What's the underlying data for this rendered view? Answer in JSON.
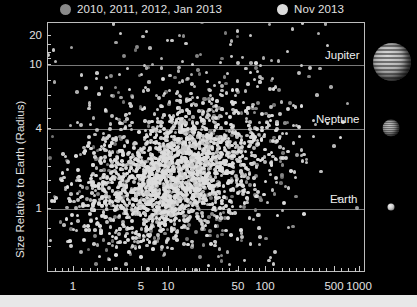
{
  "figure": {
    "background": "#000000",
    "axis_color": "#bdbdbd",
    "text_color": "#e2e2e2"
  },
  "legend": {
    "entries": [
      {
        "label": "2010, 2011, 2012, Jan 2013",
        "color": "#8a8a8a",
        "size": 11,
        "x": 60
      },
      {
        "label": "Nov 2013",
        "color": "#dcdcdc",
        "size": 11,
        "x": 277
      }
    ]
  },
  "axes": {
    "ylabel": "Size Relative to Earth (Radius)",
    "xlabel": "",
    "y_ticks": [
      {
        "value": 20,
        "label": "20",
        "y": 35
      },
      {
        "value": 10,
        "label": "10",
        "y": 64
      },
      {
        "value": 4,
        "label": "4",
        "y": 128
      },
      {
        "value": 1,
        "label": "1",
        "y": 208
      }
    ],
    "x_ticks": [
      {
        "value": 1,
        "label": "1",
        "x": 73
      },
      {
        "value": 5,
        "label": "5",
        "x": 141
      },
      {
        "value": 10,
        "label": "10",
        "x": 168
      },
      {
        "value": 50,
        "label": "50",
        "x": 238
      },
      {
        "value": 100,
        "label": "100",
        "x": 265
      },
      {
        "value": 500,
        "label": "500",
        "x": 334
      },
      {
        "value": 1000,
        "label": "1000",
        "x": 359
      }
    ],
    "x_minor_ticks": [
      55,
      62,
      68,
      73,
      81,
      90,
      97,
      104,
      112,
      120,
      127,
      134,
      141,
      148,
      156,
      162,
      168,
      176,
      185,
      192,
      199,
      207,
      215,
      222,
      229,
      238,
      245,
      252,
      259,
      265,
      273,
      282,
      289,
      296,
      304,
      312,
      319,
      326,
      334,
      341,
      348,
      355,
      359
    ],
    "y_minor_ticks": [
      35,
      44,
      52,
      58,
      64,
      80,
      95,
      108,
      118,
      128,
      148,
      166,
      180,
      192,
      208,
      228,
      246
    ],
    "xlim_log10": [
      -0.22,
      3.08
    ],
    "ylim_log10": [
      -0.52,
      1.43
    ],
    "grid": "horizontal-reference-lines-only"
  },
  "reference_lines": [
    {
      "name": "Jupiter",
      "radius": 11.2,
      "y": 64,
      "label": "Jupiter",
      "label_x": 325
    },
    {
      "name": "Neptune",
      "radius": 3.9,
      "y": 128,
      "label": "Neptune",
      "label_x": 316
    },
    {
      "name": "Earth",
      "radius": 1.0,
      "y": 208,
      "label": "Earth",
      "label_x": 330
    }
  ],
  "planet_icons": [
    {
      "name": "jupiter-image",
      "cx": 392,
      "cy": 62,
      "d": 38
    },
    {
      "name": "neptune-image",
      "cx": 391,
      "cy": 128,
      "d": 17
    },
    {
      "name": "earth-image",
      "cx": 391,
      "cy": 207,
      "d": 7
    }
  ],
  "plot_box": {
    "left": 47,
    "top": 22,
    "width": 318,
    "height": 250
  },
  "chart_data": {
    "type": "scatter",
    "title": "",
    "xlabel": "",
    "ylabel": "Size Relative to Earth (Radius)",
    "xscale": "log",
    "yscale": "log",
    "xlim": [
      0.6,
      1200
    ],
    "ylim": [
      0.3,
      27
    ],
    "xticks": [
      1,
      5,
      10,
      50,
      100,
      500,
      1000
    ],
    "yticks": [
      1,
      4,
      10,
      20
    ],
    "legend_position": "top",
    "annotations": [
      "Jupiter",
      "Neptune",
      "Earth"
    ],
    "series": [
      {
        "name": "2010, 2011, 2012, Jan 2013",
        "color": "#8a8a8a",
        "marker": "circle",
        "marker_size": 3.6,
        "n_points": 300,
        "distribution": {
          "type": "log-normal-cluster",
          "x_center_log10": 1.12,
          "x_sigma_log10": 0.62,
          "y_center_log10": 0.28,
          "y_sigma_log10": 0.44,
          "correlation": 0.2
        }
      },
      {
        "name": "Nov 2013",
        "color": "#dcdcdc",
        "marker": "circle",
        "marker_size": 3.6,
        "n_points": 1900,
        "distribution": {
          "type": "log-normal-cluster",
          "x_center_log10": 1.07,
          "x_sigma_log10": 0.47,
          "y_center_log10": 0.25,
          "y_sigma_log10": 0.26,
          "correlation": 0.34
        }
      },
      {
        "name": "Nov 2013 sparse halo",
        "color": "#c9c9c9",
        "marker": "circle",
        "marker_size": 3.4,
        "n_points": 420,
        "distribution": {
          "type": "log-normal-cluster",
          "x_center_log10": 1.18,
          "x_sigma_log10": 0.78,
          "y_center_log10": 0.55,
          "y_sigma_log10": 0.52,
          "correlation": 0.1
        }
      }
    ]
  }
}
